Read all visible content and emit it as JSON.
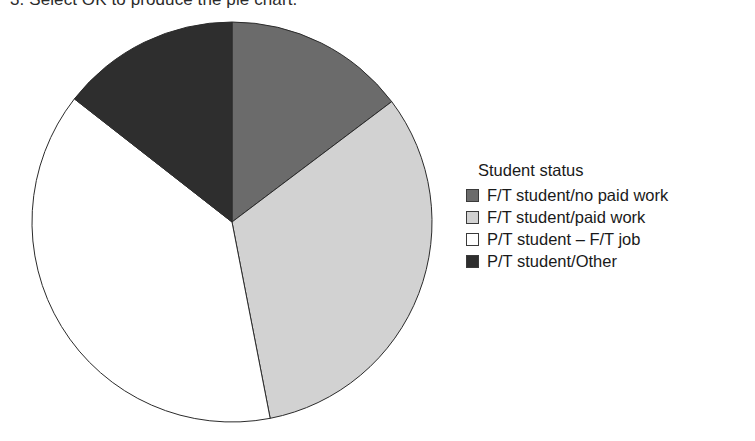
{
  "caption": {
    "text": "3. Select OK to produce the pie chart."
  },
  "legend": {
    "title": "Student status",
    "items": [
      {
        "label": "F/T student/no paid work",
        "swatch_color": "#6b6b6b",
        "swatch_name": "legend-swatch-ft-no-paid-work"
      },
      {
        "label": "F/T student/paid work",
        "swatch_color": "#d2d2d2",
        "swatch_name": "legend-swatch-ft-paid-work"
      },
      {
        "label": "P/T student – F/T job",
        "swatch_color": "#ffffff",
        "swatch_name": "legend-swatch-pt-ft-job"
      },
      {
        "label": "P/T student/Other",
        "swatch_color": "#2e2e2e",
        "swatch_name": "legend-swatch-pt-other"
      }
    ]
  },
  "chart_data": {
    "type": "pie",
    "title": "Student status",
    "xlabel": "",
    "ylabel": "",
    "legend_position": "right",
    "grid": false,
    "start_angle_deg": 0,
    "direction": "clockwise",
    "center": {
      "x": 232,
      "y": 222
    },
    "radius": 200,
    "labels": [
      "F/T student/no paid work",
      "F/T student/paid work",
      "P/T student – F/T job",
      "P/T student/Other"
    ],
    "colors": [
      "#6b6b6b",
      "#d2d2d2",
      "#ffffff",
      "#2e2e2e"
    ],
    "values": [
      14.7,
      32.2,
      38.6,
      14.5
    ],
    "value_unit": "percent",
    "slice_angles_deg": [
      {
        "label": "F/T student/no paid work",
        "start": 0,
        "end": 53
      },
      {
        "label": "F/T student/paid work",
        "start": 53,
        "end": 169
      },
      {
        "label": "P/T student – F/T job",
        "start": 169,
        "end": 308
      },
      {
        "label": "P/T student/Other",
        "start": 308,
        "end": 360
      }
    ],
    "stroke_color": "#2b2b2b",
    "stroke_width": 1
  }
}
